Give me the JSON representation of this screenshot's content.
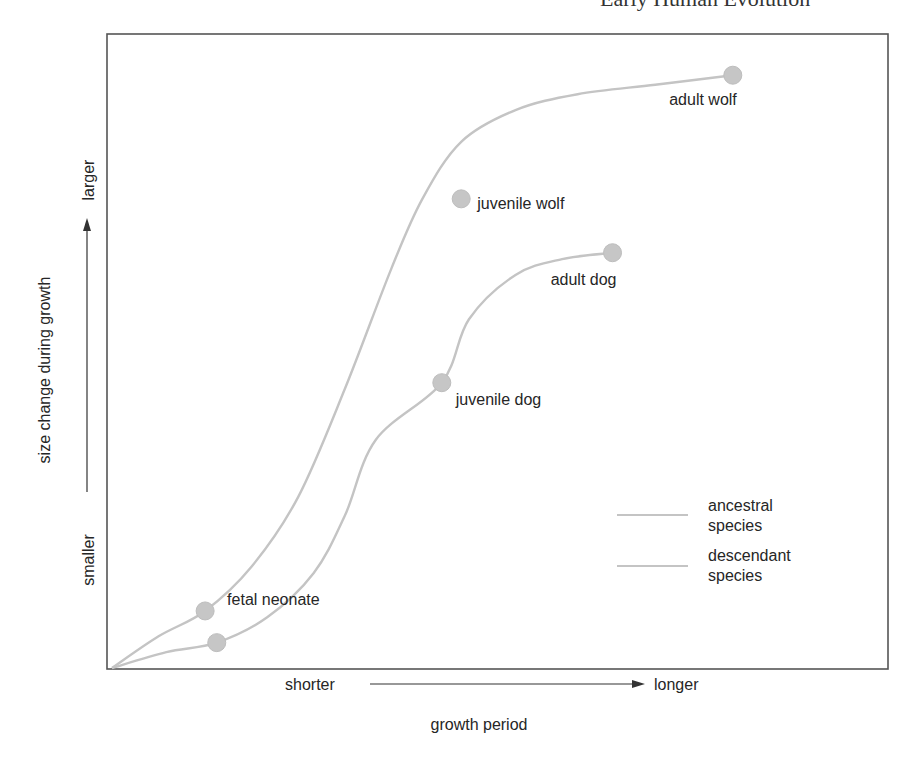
{
  "header": {
    "cropped_text": "Early Human Evolution"
  },
  "chart_data": {
    "type": "line",
    "title": "",
    "xlabel": "growth period",
    "ylabel": "size change during growth",
    "x_axis": {
      "low_label": "shorter",
      "high_label": "longer",
      "range": [
        0,
        1
      ]
    },
    "y_axis": {
      "low_label": "smaller",
      "high_label": "larger",
      "range": [
        0,
        1
      ]
    },
    "grid": false,
    "legend": {
      "placement": "bottom-right",
      "entries": [
        {
          "label": "ancestral species",
          "line1": "ancestral",
          "line2": "species"
        },
        {
          "label": "descendant species",
          "line1": "descendant",
          "line2": "species"
        }
      ]
    },
    "series": [
      {
        "name": "ancestral species (wolf)",
        "curve": [
          [
            0,
            0
          ],
          [
            0.06,
            0.05
          ],
          [
            0.12,
            0.09
          ],
          [
            0.18,
            0.16
          ],
          [
            0.24,
            0.27
          ],
          [
            0.3,
            0.44
          ],
          [
            0.36,
            0.63
          ],
          [
            0.4,
            0.74
          ],
          [
            0.45,
            0.83
          ],
          [
            0.52,
            0.88
          ],
          [
            0.6,
            0.905
          ],
          [
            0.7,
            0.92
          ],
          [
            0.8,
            0.935
          ]
        ],
        "points": [
          {
            "label": "fetal neonate",
            "x": 0.12,
            "y": 0.09
          },
          {
            "label": "juvenile wolf",
            "x": 0.45,
            "y": 0.74
          },
          {
            "label": "adult wolf",
            "x": 0.8,
            "y": 0.935
          }
        ]
      },
      {
        "name": "descendant species (dog)",
        "curve": [
          [
            0,
            0
          ],
          [
            0.07,
            0.025
          ],
          [
            0.135,
            0.04
          ],
          [
            0.2,
            0.08
          ],
          [
            0.26,
            0.15
          ],
          [
            0.3,
            0.24
          ],
          [
            0.34,
            0.36
          ],
          [
            0.425,
            0.45
          ],
          [
            0.46,
            0.55
          ],
          [
            0.52,
            0.62
          ],
          [
            0.58,
            0.645
          ],
          [
            0.645,
            0.655
          ]
        ],
        "points": [
          {
            "label": "",
            "x": 0.135,
            "y": 0.04
          },
          {
            "label": "juvenile dog",
            "x": 0.425,
            "y": 0.45
          },
          {
            "label": "adult dog",
            "x": 0.645,
            "y": 0.655
          }
        ]
      }
    ]
  }
}
